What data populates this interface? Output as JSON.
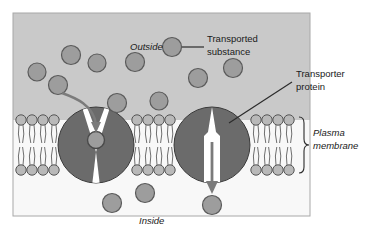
{
  "figure": {
    "panel": {
      "x": 13,
      "y": 13,
      "width": 297,
      "height": 203,
      "outside_fill": "#c9c9c9",
      "inside_fill": "#f7f7f7",
      "border_color": "#9a9a9a"
    }
  },
  "labels": {
    "outside": "Outside",
    "inside": "Inside",
    "plasma_membrane_line1": "Plasma",
    "plasma_membrane_line2": "membrane",
    "transported_substance_line1": "Transported",
    "transported_substance_line2": "substance",
    "transporter_protein_line1": "Transporter",
    "transporter_protein_line2": "protein"
  },
  "colors": {
    "substance_fill": "#9d9d9d",
    "substance_stroke": "#5a5a5a",
    "protein_fill": "#6b6b6b",
    "protein_stroke": "#3a3a3a",
    "lipid_head_fill": "#b9b9b9",
    "lipid_head_stroke": "#555555",
    "lipid_tail_stroke": "#6f6f6f",
    "arrow_color": "#7b7b7b",
    "leader_color": "#2b2b2b",
    "channel_fill": "#ffffff",
    "text_color": "#1a1a1a"
  },
  "membrane": {
    "top_y": 120,
    "bottom_y": 170,
    "head_radius": 5.2,
    "segments": [
      {
        "name": "left-bilayer-segment",
        "x_start": 15,
        "x_end": 60
      },
      {
        "name": "middle-bilayer-segment",
        "x_start": 131,
        "x_end": 176
      },
      {
        "name": "right-bilayer-segment",
        "x_start": 250,
        "x_end": 296
      }
    ]
  },
  "transporters": [
    {
      "name": "left-transporter-protein",
      "cx": 96,
      "cy": 145,
      "r": 38,
      "channel": "open-outward",
      "contains_substance": true,
      "substance": {
        "cx": 96,
        "cy": 140,
        "r": 8.5
      }
    },
    {
      "name": "right-transporter-protein",
      "cx": 212,
      "cy": 145,
      "r": 38,
      "channel": "open-inward",
      "contains_substance": false
    }
  ],
  "substances_outside": [
    {
      "cx": 37,
      "cy": 72,
      "r": 9
    },
    {
      "cx": 71,
      "cy": 55,
      "r": 9.5
    },
    {
      "cx": 58,
      "cy": 85,
      "r": 9.5
    },
    {
      "cx": 97,
      "cy": 63,
      "r": 9
    },
    {
      "cx": 117,
      "cy": 103,
      "r": 9.5
    },
    {
      "cx": 135,
      "cy": 62,
      "r": 9.5
    },
    {
      "cx": 159,
      "cy": 101,
      "r": 9
    },
    {
      "cx": 172,
      "cy": 47,
      "r": 9.5
    },
    {
      "cx": 198,
      "cy": 78,
      "r": 9.5
    },
    {
      "cx": 233,
      "cy": 68,
      "r": 9.5
    }
  ],
  "substances_inside": [
    {
      "cx": 112,
      "cy": 203,
      "r": 9.5
    },
    {
      "cx": 145,
      "cy": 193,
      "r": 9.5
    },
    {
      "cx": 212,
      "cy": 205,
      "r": 9.5
    }
  ],
  "arrows": [
    {
      "name": "influx-arrow-curved",
      "from": [
        62,
        93
      ],
      "to": [
        96,
        131
      ],
      "style": "curved-down"
    },
    {
      "name": "efflux-arrow-straight",
      "from": [
        212,
        143
      ],
      "to": [
        212,
        192
      ],
      "style": "straight-down"
    }
  ],
  "leaders": [
    {
      "name": "transported-substance-leader",
      "from": [
        182,
        47
      ],
      "to": [
        203,
        47
      ]
    },
    {
      "name": "transporter-protein-leader",
      "from": [
        228,
        122
      ],
      "to": [
        292,
        81
      ]
    }
  ],
  "bracket": {
    "name": "plasma-membrane-bracket",
    "x": 300,
    "y_top": 117,
    "y_bottom": 173
  },
  "label_positions": {
    "outside": {
      "x": 130,
      "y": 50
    },
    "inside": {
      "x": 139,
      "y": 224
    },
    "transported_substance": {
      "x": 207,
      "y": 43
    },
    "transporter_protein": {
      "x": 296,
      "y": 78
    },
    "plasma_membrane": {
      "x": 310,
      "y": 139
    }
  }
}
